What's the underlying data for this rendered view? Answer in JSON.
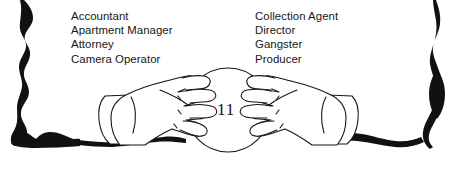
{
  "page": {
    "background_color": "#ffffff",
    "ink_color": "#161616",
    "width": 461,
    "height": 169
  },
  "border": {
    "name": "brush-stroke-frame",
    "color": "#111111",
    "edges": [
      "left",
      "bottom",
      "right"
    ]
  },
  "occupations": {
    "left_column": [
      "Accountant",
      "Apartment Manager",
      "Attorney",
      "Camera Operator"
    ],
    "right_column": [
      "Collection Agent",
      "Director",
      "Gangster",
      "Producer"
    ]
  },
  "illustration": {
    "name": "hands-over-crystal-ball",
    "number": "11",
    "line_color": "#161616",
    "fill_color": "#ffffff"
  }
}
